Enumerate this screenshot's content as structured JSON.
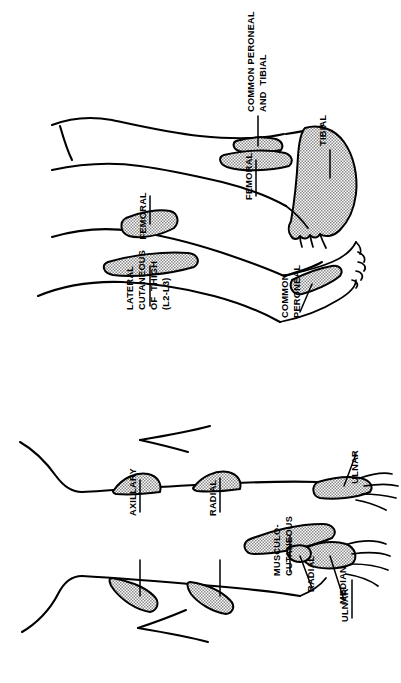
{
  "figure": {
    "orientation": "rotated-90",
    "background_color": "#ffffff",
    "ink_color": "#000000",
    "patch_fill_color": "#a8a8a8",
    "patch_pattern": "checkerboard-dither"
  },
  "panels": [
    {
      "id": "lower-limb",
      "name": "Lower limb nerve blocks",
      "labels": [
        {
          "id": "common-peroneal-and-tibial",
          "lines": [
            "COMMON PERONEAL",
            "AND  TIBIAL"
          ]
        },
        {
          "id": "tibial",
          "lines": [
            "TIBIAL"
          ]
        },
        {
          "id": "femoral-posterior",
          "lines": [
            "FEMORAL"
          ]
        },
        {
          "id": "femoral-anterior",
          "lines": [
            "FEMORAL"
          ]
        },
        {
          "id": "lateral-cutaneous-of-thigh",
          "lines": [
            "LATERAL",
            "CUTANEOUS",
            "OF  THIGH",
            "(L2-L3)"
          ]
        },
        {
          "id": "common-peroneal",
          "lines": [
            "COMMON",
            "PERONEAL"
          ]
        }
      ]
    },
    {
      "id": "upper-limb",
      "name": "Upper limb nerve blocks",
      "labels": [
        {
          "id": "axillary",
          "lines": [
            "AXILLARY"
          ]
        },
        {
          "id": "radial-upper",
          "lines": [
            "RADIAL"
          ]
        },
        {
          "id": "musculo-cutaneous",
          "lines": [
            "MUSCULO-",
            "CUTANEOUS"
          ]
        },
        {
          "id": "radial-wrist",
          "lines": [
            "RADIAL"
          ]
        },
        {
          "id": "median",
          "lines": [
            "MEDIAN"
          ]
        },
        {
          "id": "ulnar-dorsal",
          "lines": [
            "ULNAR"
          ]
        },
        {
          "id": "ulnar-palmar",
          "lines": [
            "ULNAR"
          ]
        }
      ]
    }
  ]
}
